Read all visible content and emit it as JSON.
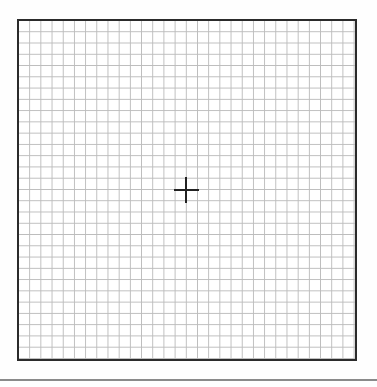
{
  "canvas": {
    "type": "grid-target",
    "grid": {
      "columns": 30,
      "rows": 30,
      "line_color": "#bcbcbc",
      "border_color": "#2b2b2b"
    },
    "marker": {
      "icon": "crosshair-icon",
      "position": "center",
      "color": "#222222"
    },
    "divider_color": "#8a8a8a"
  }
}
